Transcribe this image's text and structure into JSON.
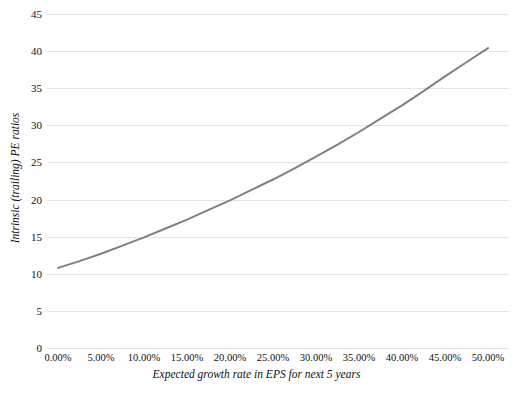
{
  "chart_data": {
    "type": "line",
    "title": "",
    "xlabel": "Expected growth rate in EPS for next 5 years",
    "ylabel": "Intrinsic (trailing) PE ratios",
    "xlim": [
      0,
      50
    ],
    "ylim": [
      0,
      45
    ],
    "grid": true,
    "legend": "none",
    "line_color": "#808080",
    "gridline_color": "#e4e4e4",
    "x_tick_labels": [
      "0.00%",
      "5.00%",
      "10.00%",
      "15.00%",
      "20.00%",
      "25.00%",
      "30.00%",
      "35.00%",
      "40.00%",
      "45.00%",
      "50.00%"
    ],
    "x_tick_values": [
      0,
      5,
      10,
      15,
      20,
      25,
      30,
      35,
      40,
      45,
      50
    ],
    "y_tick_labels": [
      "45",
      "40",
      "35",
      "30",
      "25",
      "20",
      "15",
      "10",
      "5",
      "0"
    ],
    "y_tick_values": [
      45,
      40,
      35,
      30,
      25,
      20,
      15,
      10,
      5,
      0
    ],
    "series": [
      {
        "name": "Intrinsic (trailing) PE ratio",
        "x": [
          0,
          2.5,
          5,
          7.5,
          10,
          12.5,
          15,
          17.5,
          20,
          22.5,
          25,
          27.5,
          30,
          32.5,
          35,
          37.5,
          40,
          42.5,
          45,
          47.5,
          50
        ],
        "values": [
          10.8,
          11.7,
          12.7,
          13.8,
          14.9,
          16.1,
          17.3,
          18.6,
          19.9,
          21.3,
          22.7,
          24.2,
          25.8,
          27.4,
          29.1,
          30.9,
          32.7,
          34.6,
          36.6,
          38.5,
          40.4
        ]
      }
    ]
  }
}
